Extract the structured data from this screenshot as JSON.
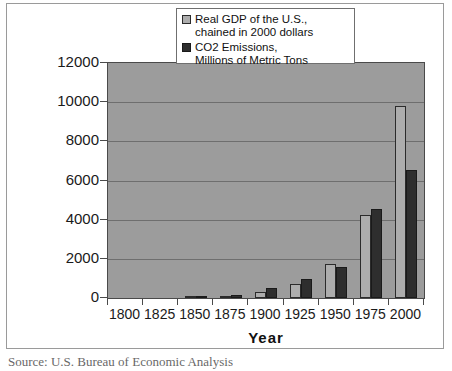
{
  "figure": {
    "source_caption": "Source:  U.S. Bureau of Economic Analysis"
  },
  "legend": {
    "position": "top-center-inside",
    "entries": [
      {
        "label": "Real GDP of the U.S.,\nchained in 2000 dollars",
        "swatch": "light-gray",
        "color": "#adadad"
      },
      {
        "label": "CO2 Emissions,\nMillions of Metric Tons",
        "swatch": "dark-gray",
        "color": "#2e2e2e"
      }
    ]
  },
  "axes": {
    "y_ticks": [
      "12000",
      "10000",
      "8000",
      "6000",
      "4000",
      "2000",
      "0"
    ],
    "x_title": "Year"
  },
  "chart_data": {
    "type": "bar",
    "title": "",
    "subtitle": "",
    "xlabel": "Year",
    "ylabel": "",
    "ylim": [
      0,
      12000
    ],
    "ytick_step": 2000,
    "grid": true,
    "legend_position": "top-center-inside",
    "plot_background": "#9c9c9c",
    "categories": [
      "1800",
      "1825",
      "1850",
      "1875",
      "1900",
      "1925",
      "1950",
      "1975",
      "2000"
    ],
    "series": [
      {
        "name": "Real GDP of the U.S., chained in 2000 dollars",
        "color": "#adadad",
        "values": [
          0,
          0,
          40,
          120,
          310,
          700,
          1750,
          4250,
          9800
        ]
      },
      {
        "name": "CO2 Emissions, Millions of Metric Tons",
        "color": "#2e2e2e",
        "values": [
          0,
          0,
          20,
          170,
          530,
          950,
          1600,
          4550,
          6550
        ]
      }
    ]
  }
}
